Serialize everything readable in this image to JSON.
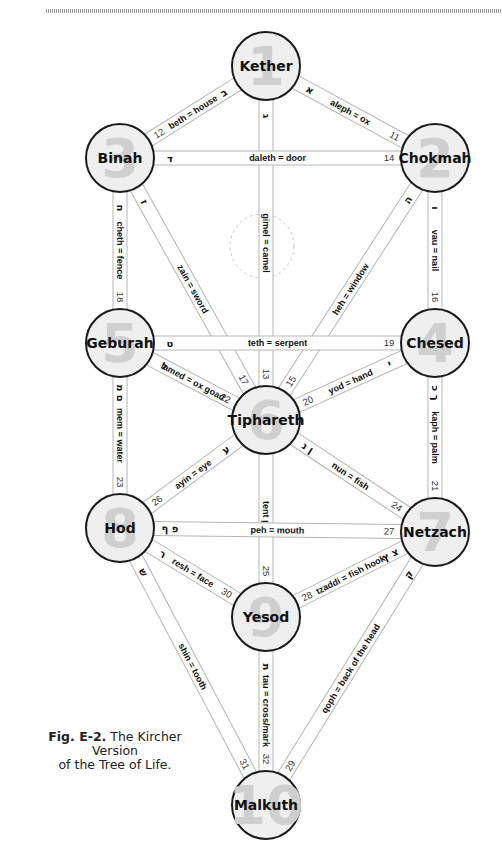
{
  "caption": {
    "figure_label": "Fig. E-2.",
    "line1": "The Kircher Version",
    "line2": "of the Tree of Life."
  },
  "colors": {
    "node_fill": "#efefef",
    "node_stroke": "#1a1a1a",
    "node_number": "#cfcfcf",
    "path_stroke": "#b5b5b5"
  },
  "nodes": [
    {
      "id": "kether",
      "number": "1",
      "name": "Kether",
      "cx": 266,
      "cy": 66
    },
    {
      "id": "chokmah",
      "number": "2",
      "name": "Chokmah",
      "cx": 435,
      "cy": 158
    },
    {
      "id": "binah",
      "number": "3",
      "name": "Binah",
      "cx": 120,
      "cy": 158
    },
    {
      "id": "chesed",
      "number": "4",
      "name": "Chesed",
      "cx": 435,
      "cy": 343
    },
    {
      "id": "geburah",
      "number": "5",
      "name": "Geburah",
      "cx": 120,
      "cy": 343
    },
    {
      "id": "tiphareth",
      "number": "6",
      "name": "Tiphareth",
      "cx": 266,
      "cy": 420
    },
    {
      "id": "netzach",
      "number": "7",
      "name": "Netzach",
      "cx": 435,
      "cy": 532
    },
    {
      "id": "hod",
      "number": "8",
      "name": "Hod",
      "cx": 120,
      "cy": 528
    },
    {
      "id": "yesod",
      "number": "9",
      "name": "Yesod",
      "cx": 266,
      "cy": 617
    },
    {
      "id": "malkuth",
      "number": "10",
      "name": "Malkuth",
      "cx": 266,
      "cy": 805
    }
  ],
  "paths": [
    {
      "number": "11",
      "label": "aleph = ox",
      "hebrew": "א",
      "from": "kether",
      "to": "chokmah"
    },
    {
      "number": "12",
      "label": "beth = house",
      "hebrew": "ב",
      "from": "kether",
      "to": "binah"
    },
    {
      "number": "13",
      "label": "gimel = camel",
      "hebrew": "ג",
      "from": "kether",
      "to": "tiphareth"
    },
    {
      "number": "14",
      "label": "daleth = door",
      "hebrew": "ד",
      "from": "binah",
      "to": "chokmah"
    },
    {
      "number": "15",
      "label": "heh = window",
      "hebrew": "ה",
      "from": "chokmah",
      "to": "tiphareth"
    },
    {
      "number": "16",
      "label": "vau = nail",
      "hebrew": "ו",
      "from": "chokmah",
      "to": "chesed"
    },
    {
      "number": "17",
      "label": "zain = sword",
      "hebrew": "ז",
      "from": "binah",
      "to": "tiphareth"
    },
    {
      "number": "18",
      "label": "cheth = fence",
      "hebrew": "ח",
      "from": "binah",
      "to": "geburah"
    },
    {
      "number": "19",
      "label": "teth = serpent",
      "hebrew": "ט",
      "from": "geburah",
      "to": "chesed"
    },
    {
      "number": "20",
      "label": "yod = hand",
      "hebrew": "י",
      "from": "chesed",
      "to": "tiphareth"
    },
    {
      "number": "21",
      "label": "kaph = palm",
      "hebrew": "ך כ",
      "from": "chesed",
      "to": "netzach"
    },
    {
      "number": "22",
      "label": "lamed = ox goad",
      "hebrew": "ל",
      "from": "geburah",
      "to": "tiphareth"
    },
    {
      "number": "23",
      "label": "mem = water",
      "hebrew": "ם מ",
      "from": "geburah",
      "to": "hod"
    },
    {
      "number": "24",
      "label": "nun = fish",
      "hebrew": "ן נ",
      "from": "tiphareth",
      "to": "netzach"
    },
    {
      "number": "25",
      "label": "tent peg",
      "hebrew": "",
      "from": "tiphareth",
      "to": "yesod"
    },
    {
      "number": "26",
      "label": "ayin = eye",
      "hebrew": "ע",
      "from": "tiphareth",
      "to": "hod"
    },
    {
      "number": "27",
      "label": "peh = mouth",
      "hebrew": "פ ף",
      "from": "hod",
      "to": "netzach"
    },
    {
      "number": "28",
      "label": "tzaddi = fish hook",
      "hebrew": "צ ץ",
      "from": "netzach",
      "to": "yesod"
    },
    {
      "number": "29",
      "label": "qoph = back of the head",
      "hebrew": "ק",
      "from": "netzach",
      "to": "malkuth"
    },
    {
      "number": "30",
      "label": "resh = face",
      "hebrew": "ר",
      "from": "hod",
      "to": "yesod"
    },
    {
      "number": "31",
      "label": "shin = tooth",
      "hebrew": "ש",
      "from": "hod",
      "to": "malkuth"
    },
    {
      "number": "32",
      "label": "tau = cross/mark",
      "hebrew": "ת",
      "from": "yesod",
      "to": "malkuth"
    }
  ],
  "extra_labels": {
    "samekh": "samekh",
    "samekh_hebrew": "ס"
  }
}
